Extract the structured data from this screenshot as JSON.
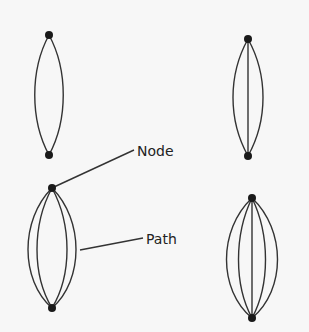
{
  "diagram": {
    "labels": {
      "node": "Node",
      "path": "Path"
    },
    "graphs": [
      {
        "id": "top-left",
        "nodes": 2,
        "paths": 2
      },
      {
        "id": "top-right",
        "nodes": 2,
        "paths": 3
      },
      {
        "id": "bottom-left",
        "nodes": 2,
        "paths": 4
      },
      {
        "id": "bottom-right",
        "nodes": 2,
        "paths": 5
      }
    ],
    "colors": {
      "stroke": "#333333",
      "node": "#1a1a1a",
      "background": "#f7f7f7"
    }
  }
}
